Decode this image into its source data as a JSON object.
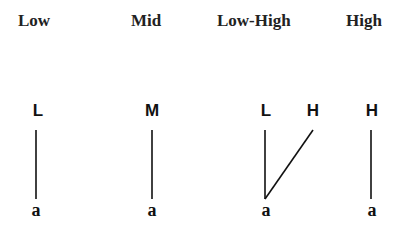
{
  "diagram": {
    "columns": [
      {
        "header": "Low",
        "tones": [
          "L"
        ],
        "segment": "a"
      },
      {
        "header": "Mid",
        "tones": [
          "M"
        ],
        "segment": "a"
      },
      {
        "header": "Low-High",
        "tones": [
          "L",
          "H"
        ],
        "segment": "a"
      },
      {
        "header": "High",
        "tones": [
          "H"
        ],
        "segment": "a"
      }
    ],
    "line_color": "#111111"
  }
}
